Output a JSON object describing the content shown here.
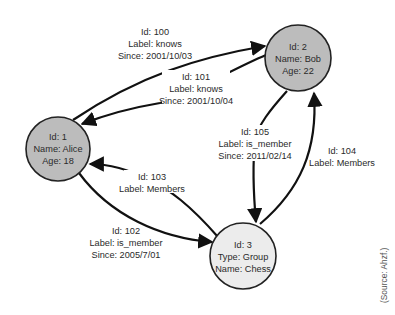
{
  "diagram": {
    "type": "property-graph",
    "colors": {
      "person_fill": "#bcbcbc",
      "group_fill": "#ececec",
      "stroke": "#222222",
      "edge": "#111111",
      "text": "#2a2a2a"
    },
    "nodes": [
      {
        "id": "1",
        "lines": [
          "Id: 1",
          "Name: Alice",
          "Age: 18"
        ]
      },
      {
        "id": "2",
        "lines": [
          "Id: 2",
          "Name: Bob",
          "Age: 22"
        ]
      },
      {
        "id": "3",
        "lines": [
          "Id: 3",
          "Type: Group",
          "Name: Chess"
        ]
      }
    ],
    "edges": [
      {
        "id": "100",
        "from": "1",
        "to": "2",
        "lines": [
          "Id: 100",
          "Label: knows",
          "Since: 2001/10/03"
        ]
      },
      {
        "id": "101",
        "from": "2",
        "to": "1",
        "lines": [
          "Id: 101",
          "Label: knows",
          "Since: 2001/10/04"
        ]
      },
      {
        "id": "102",
        "from": "1",
        "to": "3",
        "lines": [
          "Id: 102",
          "Label: is_member",
          "Since: 2005/7/01"
        ]
      },
      {
        "id": "103",
        "from": "3",
        "to": "1",
        "lines": [
          "Id: 103",
          "Label: Members"
        ]
      },
      {
        "id": "104",
        "from": "3",
        "to": "2",
        "lines": [
          "Id: 104",
          "Label: Members"
        ]
      },
      {
        "id": "105",
        "from": "2",
        "to": "3",
        "lines": [
          "Id: 105",
          "Label: is_member",
          "Since: 2011/02/14"
        ]
      }
    ],
    "source": "(Source: Ahzf.)"
  }
}
